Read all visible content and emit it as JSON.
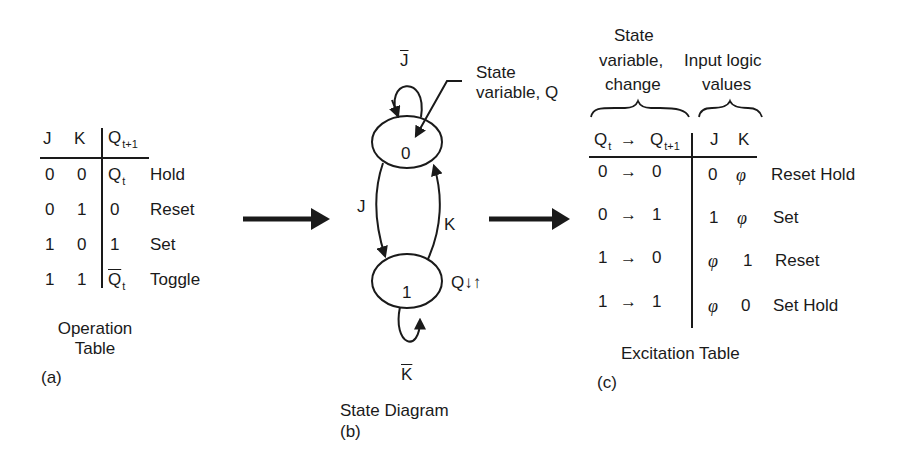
{
  "operation_table": {
    "headers": {
      "j": "J",
      "k": "K",
      "q_next": "Q",
      "q_next_sub": "t+1"
    },
    "rows": [
      {
        "j": "0",
        "k": "0",
        "q": "Q",
        "q_sub": "t",
        "q_bar": false,
        "label": "Hold"
      },
      {
        "j": "0",
        "k": "1",
        "q": "0",
        "q_sub": "",
        "q_bar": false,
        "label": "Reset"
      },
      {
        "j": "1",
        "k": "0",
        "q": "1",
        "q_sub": "",
        "q_bar": false,
        "label": "Set"
      },
      {
        "j": "1",
        "k": "1",
        "q": "Q",
        "q_sub": "t",
        "q_bar": true,
        "label": "Toggle"
      }
    ],
    "caption_line1": "Operation",
    "caption_line2": "Table",
    "panel_label": "(a)"
  },
  "state_diagram": {
    "states": [
      {
        "label": "0"
      },
      {
        "label": "1"
      }
    ],
    "transitions": {
      "self_loop_0": "J",
      "zero_to_one": "J",
      "one_to_zero": "K",
      "self_loop_1": "K"
    },
    "annotation_line1": "State",
    "annotation_line2": "variable, Q",
    "output_label": "Q↓↑",
    "caption": "State Diagram",
    "panel_label": "(b)"
  },
  "excitation_table": {
    "group_headers": {
      "left_line1": "State",
      "left_line2": "variable,",
      "left_line3": "change",
      "right_line1": "Input logic",
      "right_line2": "values"
    },
    "headers": {
      "qt": "Q",
      "qt_sub": "t",
      "arrow": "→",
      "qn": "Q",
      "qn_sub": "t+1",
      "j": "J",
      "k": "K"
    },
    "rows": [
      {
        "from": "0",
        "to": "0",
        "j": "0",
        "k": "φ",
        "label": "Reset Hold"
      },
      {
        "from": "0",
        "to": "1",
        "j": "1",
        "k": "φ",
        "label": "Set"
      },
      {
        "from": "1",
        "to": "0",
        "j": "φ",
        "k": "1",
        "label": "Reset"
      },
      {
        "from": "1",
        "to": "1",
        "j": "φ",
        "k": "0",
        "label": "Set Hold"
      }
    ],
    "arrow": "→",
    "caption": "Excitation Table",
    "panel_label": "(c)"
  },
  "colors": {
    "ink": "#1a1a1a",
    "background": "#ffffff"
  }
}
